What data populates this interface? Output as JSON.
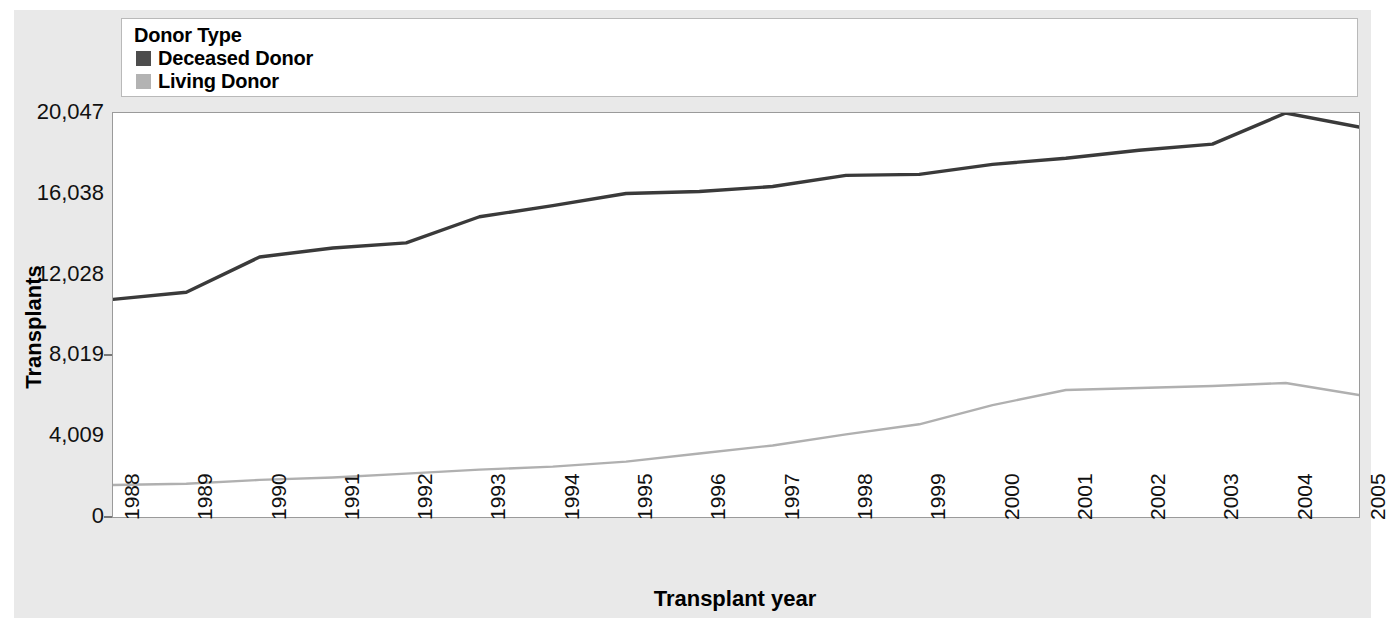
{
  "legend": {
    "title": "Donor Type",
    "items": [
      {
        "label": "Deceased Donor",
        "color": "#4d4d4d"
      },
      {
        "label": "Living Donor",
        "color": "#b3b3b3"
      }
    ]
  },
  "axes": {
    "ylabel": "Transplants",
    "xlabel": "Transplant year",
    "yticks": [
      "0",
      "4,009",
      "8,019",
      "12,028",
      "16,038",
      "20,047"
    ]
  },
  "chart_data": {
    "type": "line",
    "title": "",
    "xlabel": "Transplant year",
    "ylabel": "Transplants",
    "categories": [
      "1988",
      "1989",
      "1990",
      "1991",
      "1992",
      "1993",
      "1994",
      "1995",
      "1996",
      "1997",
      "1998",
      "1999",
      "2000",
      "2001",
      "2002",
      "2003",
      "2004",
      "2005"
    ],
    "x": [
      1988,
      1989,
      1990,
      1991,
      1992,
      1993,
      1994,
      1995,
      1996,
      1997,
      1998,
      1999,
      2000,
      2001,
      2002,
      2003,
      2004,
      2005
    ],
    "series": [
      {
        "name": "Deceased Donor",
        "color": "#3a3a3a",
        "values": [
          10800,
          11150,
          12900,
          13350,
          13600,
          14900,
          15450,
          16050,
          16150,
          16400,
          16950,
          17000,
          17500,
          17800,
          18200,
          18500,
          20047,
          19350
        ]
      },
      {
        "name": "Living Donor",
        "color": "#b0b0b0",
        "values": [
          1590,
          1650,
          1840,
          1960,
          2150,
          2350,
          2500,
          2750,
          3150,
          3550,
          4100,
          4600,
          5550,
          6300,
          6400,
          6500,
          6650,
          6050
        ]
      }
    ],
    "ylim": [
      0,
      20047
    ],
    "yticks": [
      0,
      4009,
      8019,
      12028,
      16038,
      20047
    ],
    "ytick_labels": [
      "0",
      "4,009",
      "8,019",
      "12,028",
      "16,038",
      "20,047"
    ],
    "grid": false,
    "legend_position": "top",
    "legend_title": "Donor Type"
  }
}
